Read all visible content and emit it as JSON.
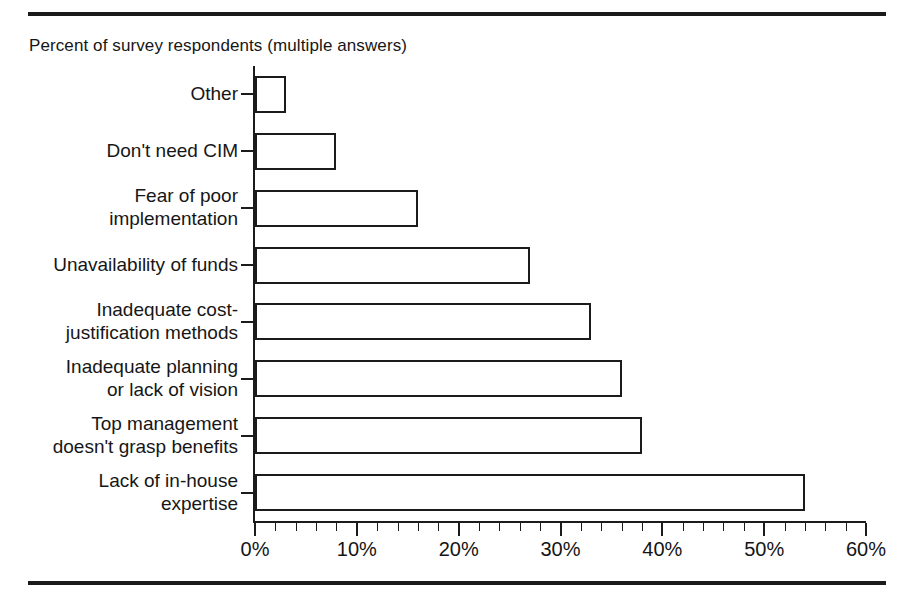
{
  "figure": {
    "subtitle": "Percent of survey respondents (multiple answers)",
    "rules": {
      "top": "top-rule",
      "bottom": "bottom-rule"
    }
  },
  "chart_data": {
    "type": "bar",
    "orientation": "horizontal",
    "title": "",
    "subtitle": "Percent of survey respondents (multiple answers)",
    "xlabel": "",
    "ylabel": "",
    "xlim": [
      0,
      60
    ],
    "grid": false,
    "legend": false,
    "x_major_ticks": [
      0,
      10,
      20,
      30,
      40,
      50,
      60
    ],
    "x_tick_labels": [
      "0%",
      "10%",
      "20%",
      "30%",
      "40%",
      "50%",
      "60%"
    ],
    "x_minor_tick_step": 2,
    "categories": [
      "Other",
      "Don't need CIM",
      "Fear of poor\nimplementation",
      "Unavailability of funds",
      "Inadequate cost-\njustification methods",
      "Inadequate planning\nor lack of vision",
      "Top management\ndoesn't grasp benefits",
      "Lack of in-house\nexpertise"
    ],
    "values": [
      3,
      8,
      16,
      27,
      33,
      36,
      38,
      54
    ],
    "value_labels": [
      "3%",
      "8%",
      "16%",
      "27%",
      "33%",
      "36%",
      "38%",
      "54%"
    ],
    "bar_fill": "#ffffff",
    "bar_edge": "#1b1b1b"
  },
  "axis": {
    "tick_color": "#1b1b1b",
    "label_color": "#141414"
  }
}
